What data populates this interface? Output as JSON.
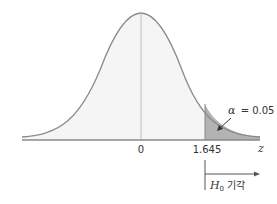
{
  "diagram": {
    "type": "normal-distribution-one-tailed-test",
    "axis_variable": "z",
    "tick_labels": [
      "0",
      "1.645"
    ],
    "alpha_label_symbol": "α",
    "alpha_label_eq": "= 0.05",
    "rejection_label_symbol": "H",
    "rejection_label_sub": "0",
    "rejection_label_text": "기각",
    "colors": {
      "curve": "#8a8a8a",
      "body_fill": "#f5f5f5",
      "tail_fill": "#b3b3b3",
      "axis": "#8a8a8a",
      "text": "#333333"
    }
  }
}
